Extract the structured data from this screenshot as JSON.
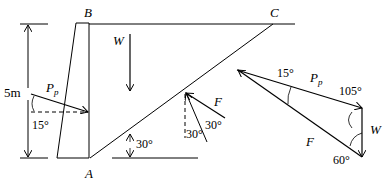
{
  "labels": {
    "B": "B",
    "C": "C",
    "A": "A",
    "W": "W",
    "Pp_main": "P",
    "Pp_sub": "p",
    "F": "F",
    "height": "5m",
    "angle_pp": "15°",
    "angle_slope": "30°",
    "angle_f1": "30°",
    "angle_f2": "30°"
  },
  "triangle": {
    "angle_top": "15°",
    "angle_right": "105°",
    "angle_bottom": "60°",
    "Pp_main": "P",
    "Pp_sub": "p",
    "W": "W",
    "F": "F"
  },
  "colors": {
    "stroke": "#000000",
    "background": "#ffffff"
  }
}
